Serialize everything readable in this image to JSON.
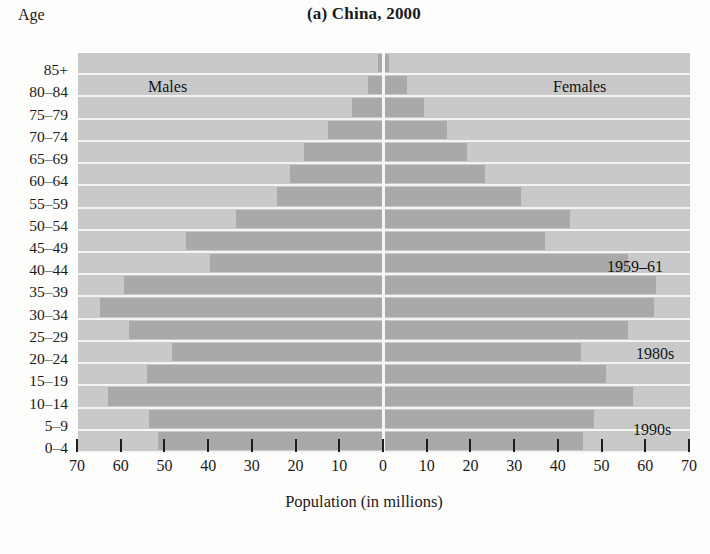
{
  "title": "(a) China, 2000",
  "axis": {
    "y_title": "Age",
    "x_title": "Population (in millions)",
    "x_ticks": [
      "70",
      "60",
      "50",
      "40",
      "30",
      "20",
      "10",
      "0",
      "10",
      "20",
      "30",
      "40",
      "50",
      "60",
      "70"
    ],
    "x_tick_values": [
      -70,
      -60,
      -50,
      -40,
      -30,
      -20,
      -10,
      0,
      10,
      20,
      30,
      40,
      50,
      60,
      70
    ],
    "x_range": [
      -70,
      70
    ]
  },
  "annotations": {
    "males": "Males",
    "females": "Females",
    "famine": "1959–61",
    "eighties": "1980s",
    "nineties": "1990s"
  },
  "colors": {
    "panel_background": "#c9c9c9",
    "bar": "#a9a9a9",
    "gridline": "#f4f4f3",
    "centerline": "#f6f6f5",
    "text": "#1a1a1a"
  },
  "chart_data": {
    "type": "bar",
    "subtype": "population-pyramid",
    "title": "(a) China, 2000",
    "xlabel": "Population (in millions)",
    "ylabel": "Age",
    "xlim": [
      -70,
      70
    ],
    "xticks": [
      70,
      60,
      50,
      40,
      30,
      20,
      10,
      0,
      10,
      20,
      30,
      40,
      50,
      60,
      70
    ],
    "grid": true,
    "legend": [
      "Males",
      "Females"
    ],
    "legend_position": "inside-top",
    "units": "millions",
    "categories": [
      "85+",
      "80–84",
      "75–79",
      "70–74",
      "65–69",
      "60–64",
      "55–59",
      "50–54",
      "45–49",
      "40–44",
      "35–39",
      "30–34",
      "25–29",
      "20–24",
      "15–19",
      "10–14",
      "5–9",
      "0–4"
    ],
    "series": [
      {
        "name": "Males",
        "side": "left",
        "values": [
          1.2,
          3.4,
          7.0,
          12.6,
          18.0,
          21.2,
          24.3,
          33.7,
          45.0,
          39.5,
          59.3,
          64.7,
          58.0,
          48.3,
          54.0,
          63.0,
          53.5,
          51.5
        ]
      },
      {
        "name": "Females",
        "side": "right",
        "values": [
          1.4,
          5.4,
          9.4,
          14.6,
          19.3,
          23.4,
          31.5,
          42.7,
          37.0,
          56.0,
          62.5,
          62.0,
          56.0,
          45.4,
          51.0,
          57.3,
          48.3,
          45.8
        ]
      }
    ],
    "annotations": [
      {
        "label": "1959–61",
        "age_group": "40–44",
        "side": "right"
      },
      {
        "label": "1980s",
        "age_group": "20–24",
        "side": "right"
      },
      {
        "label": "1990s",
        "age_group": "5–9",
        "side": "right"
      }
    ]
  }
}
